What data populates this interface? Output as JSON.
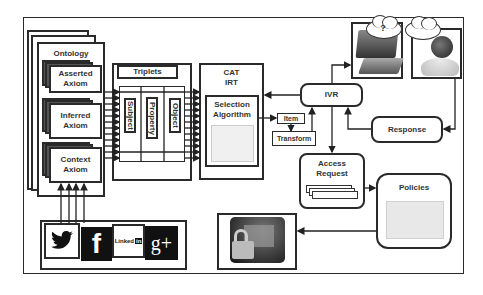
{
  "ontology": {
    "title": "Ontology",
    "axioms": [
      {
        "label_line1": "Asserted",
        "label_line2": "Axiom"
      },
      {
        "label_line1": "Inferred",
        "label_line2": "Axiom"
      },
      {
        "label_line1": "Context",
        "label_line2": "Axiom"
      }
    ]
  },
  "triplets": {
    "title": "Triplets",
    "columns": [
      "Subject",
      "Property",
      "Object"
    ]
  },
  "cat": {
    "title_line1": "CAT",
    "title_line2": "IRT",
    "selection_line1": "Selection",
    "selection_line2": "Algorithm"
  },
  "item": {
    "label": "Item"
  },
  "transform": {
    "label": "Transform"
  },
  "ivr": {
    "label": "IVR"
  },
  "response": {
    "label": "Response"
  },
  "access_request": {
    "label_line1": "Access",
    "label_line2": "Request"
  },
  "policies": {
    "label": "Policies"
  },
  "cloud_question": {
    "label": "?"
  },
  "social": {
    "icons": [
      {
        "name": "twitter-icon",
        "glyph": "🐦"
      },
      {
        "name": "facebook-icon",
        "glyph": "f"
      },
      {
        "name": "linkedin-icon",
        "text": "Linked",
        "badge": "in"
      },
      {
        "name": "google-plus-icon",
        "glyph": "g+"
      }
    ]
  },
  "colors": {
    "stroke": "#2a2a2a",
    "dark_fill": "#1c1c1c",
    "light_fill": "#ffffff",
    "policy_fill": "#e8e8e8"
  }
}
